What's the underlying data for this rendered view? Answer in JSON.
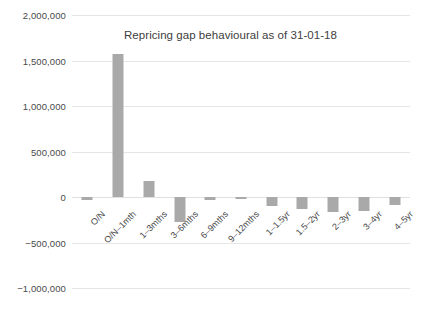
{
  "chart_data": {
    "type": "bar",
    "title": "Repricing gap behavioural as of 31-01-18",
    "xlabel": "",
    "ylabel": "",
    "categories": [
      "O/N",
      "O/N–1mth",
      "1–3mths",
      "3–6mths",
      "6–9mths",
      "9–12mths",
      "1–1.5yr",
      "1.5–2yr",
      "2–3yr",
      "3–4yr",
      "4–5yr"
    ],
    "values": [
      -30000,
      1570000,
      180000,
      -275000,
      -30000,
      -25000,
      -100000,
      -130000,
      -170000,
      -150000,
      -90000
    ],
    "ylim": [
      -1000000,
      2000000
    ],
    "ytick_values": [
      2000000,
      1500000,
      1000000,
      500000,
      0,
      -500000,
      -1000000
    ],
    "ytick_labels": [
      "2,000,000",
      "1,500,000",
      "1,000,000",
      "500,000",
      "0",
      "−500,000",
      "−1,000,000"
    ],
    "grid": true,
    "legend": false,
    "bar_color": "#a9a9a9",
    "gridline_color": "#e6e6e6",
    "text_color": "#4a4a4a",
    "background_color": "#ffffff",
    "xtick_rotation": -45
  }
}
